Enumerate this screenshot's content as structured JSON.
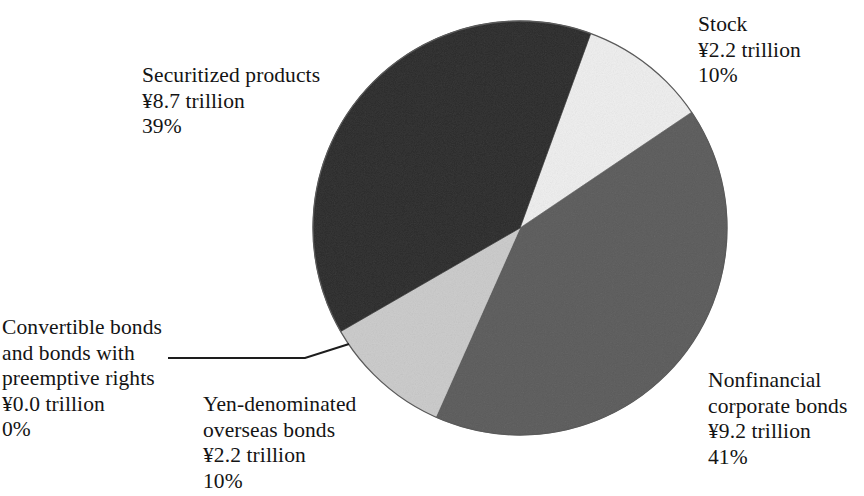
{
  "chart_data": {
    "type": "pie",
    "title": "",
    "subtitle": "",
    "xlabel": "",
    "ylabel": "",
    "legend_position": "none",
    "grid": false,
    "units": "trillion yen",
    "currency_symbol": "¥",
    "total_percent": 100,
    "categories": [
      "Securitized products",
      "Stock",
      "Nonfinancial corporate bonds",
      "Convertible bonds and bonds with preemptive rights",
      "Yen-denominated overseas bonds"
    ],
    "values": [
      8.7,
      2.2,
      9.2,
      0.0,
      2.2
    ],
    "percents": [
      39,
      10,
      41,
      0,
      10
    ],
    "colors": [
      "#6f6f6f",
      "#f7f7f7",
      "#9b9b9b",
      "#6f6f6f",
      "#e4e4e4"
    ],
    "slices": [
      {
        "name": "stock",
        "label": "Stock",
        "value_text": "¥2.2 trillion",
        "percent_text": "10%",
        "value": 2.2,
        "percent": 10,
        "color": "#f7f7f7",
        "start_angle": 20,
        "end_angle": 56
      },
      {
        "name": "nonfinancial-corporate-bonds",
        "label_line1": "Nonfinancial",
        "label_line2": "corporate bonds",
        "value_text": "¥9.2 trillion",
        "percent_text": "41%",
        "value": 9.2,
        "percent": 41,
        "color": "#9b9b9b",
        "start_angle": 56,
        "end_angle": 204
      },
      {
        "name": "convertible-bonds",
        "label_line1": "Convertible bonds",
        "label_line2": "and bonds with",
        "label_line3": "preemptive rights",
        "value_text": "¥0.0 trillion",
        "percent_text": "0%",
        "value": 0.0,
        "percent": 0,
        "color": "#6f6f6f",
        "start_angle": 204,
        "end_angle": 204
      },
      {
        "name": "yen-denominated-overseas-bonds",
        "label_line1": "Yen-denominated",
        "label_line2": "overseas bonds",
        "value_text": "¥2.2 trillion",
        "percent_text": "10%",
        "value": 2.2,
        "percent": 10,
        "color": "#e4e4e4",
        "start_angle": 204,
        "end_angle": 240
      },
      {
        "name": "securitized-products",
        "label": "Securitized products",
        "value_text": "¥8.7 trillion",
        "percent_text": "39%",
        "value": 8.7,
        "percent": 39,
        "color": "#6f6f6f",
        "start_angle": 240,
        "end_angle": 380
      }
    ]
  },
  "labels": {
    "stock": {
      "line1": "Stock",
      "line2": "¥2.2 trillion",
      "line3": "10%"
    },
    "securitized": {
      "line1": "Securitized products",
      "line2": "¥8.7 trillion",
      "line3": "39%"
    },
    "nonfinancial": {
      "line1": "Nonfinancial",
      "line2": "corporate bonds",
      "line3": "¥9.2 trillion",
      "line4": "41%"
    },
    "yen": {
      "line1": "Yen-denominated",
      "line2": "overseas bonds",
      "line3": "¥2.2 trillion",
      "line4": "10%"
    },
    "convertible": {
      "line1": "Convertible bonds",
      "line2": "and bonds with",
      "line3": "preemptive rights",
      "line4": "¥0.0 trillion",
      "line5": "0%"
    }
  },
  "geometry": {
    "center_x": 520,
    "center_y": 228,
    "radius": 207
  }
}
